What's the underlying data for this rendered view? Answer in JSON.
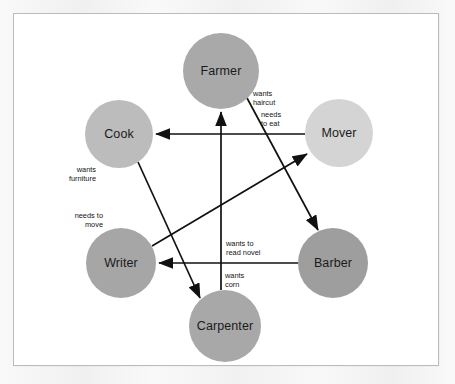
{
  "figure": {
    "type": "directed-graph",
    "frame_border_color": "#b9bcbe",
    "background_color": "#ffffff",
    "page_background_color": "#f2f2f2",
    "edge_color": "#111111"
  },
  "nodes": [
    {
      "id": "farmer",
      "label": "Farmer",
      "cx": 207,
      "cy": 57,
      "r": 38,
      "color": "#a9a9a9"
    },
    {
      "id": "mover",
      "label": "Mover",
      "cx": 325,
      "cy": 119,
      "r": 34,
      "color": "#d4d4d4"
    },
    {
      "id": "barber",
      "label": "Barber",
      "cx": 319,
      "cy": 249,
      "r": 35,
      "color": "#9e9e9e"
    },
    {
      "id": "carpenter",
      "label": "Carpenter",
      "cx": 211,
      "cy": 312,
      "r": 36,
      "color": "#a8a8a8"
    },
    {
      "id": "writer",
      "label": "Writer",
      "cx": 107,
      "cy": 249,
      "r": 35,
      "color": "#a6a6a6"
    },
    {
      "id": "cook",
      "label": "Cook",
      "cx": 105,
      "cy": 120,
      "r": 34,
      "color": "#bcbcbc"
    }
  ],
  "edges": [
    {
      "id": "farmer-to-barber",
      "from": "Farmer",
      "to": "Barber",
      "label": "wants\nhaircut",
      "x1": 233,
      "y1": 84,
      "x2": 304,
      "y2": 216,
      "label_x": 239,
      "label_y": 76,
      "align": "left"
    },
    {
      "id": "mover-to-cook",
      "from": "Mover",
      "to": "Cook",
      "label": "needs\nto eat",
      "x1": 291,
      "y1": 120,
      "x2": 142,
      "y2": 120,
      "label_x": 247,
      "label_y": 97,
      "align": "left"
    },
    {
      "id": "writer-to-mover",
      "from": "Writer",
      "to": "Mover",
      "label": "needs to\nmove",
      "x1": 138,
      "y1": 232,
      "x2": 293,
      "y2": 140,
      "label_x": 89,
      "label_y": 198,
      "align": "right"
    },
    {
      "id": "barber-to-writer",
      "from": "Barber",
      "to": "Writer",
      "label": "wants to\nread novel",
      "x1": 284,
      "y1": 249,
      "x2": 145,
      "y2": 249,
      "label_x": 212,
      "label_y": 226,
      "align": "left"
    },
    {
      "id": "carpenter-to-farmer",
      "from": "Carpenter",
      "to": "Farmer",
      "label": "wants\ncorn",
      "x1": 207,
      "y1": 276,
      "x2": 207,
      "y2": 98,
      "label_x": 211,
      "label_y": 258,
      "align": "left"
    },
    {
      "id": "cook-to-carpenter",
      "from": "Cook",
      "to": "Carpenter",
      "label": "wants\nfurniture",
      "x1": 124,
      "y1": 148,
      "x2": 186,
      "y2": 284,
      "label_x": 82,
      "label_y": 152,
      "align": "right"
    }
  ]
}
